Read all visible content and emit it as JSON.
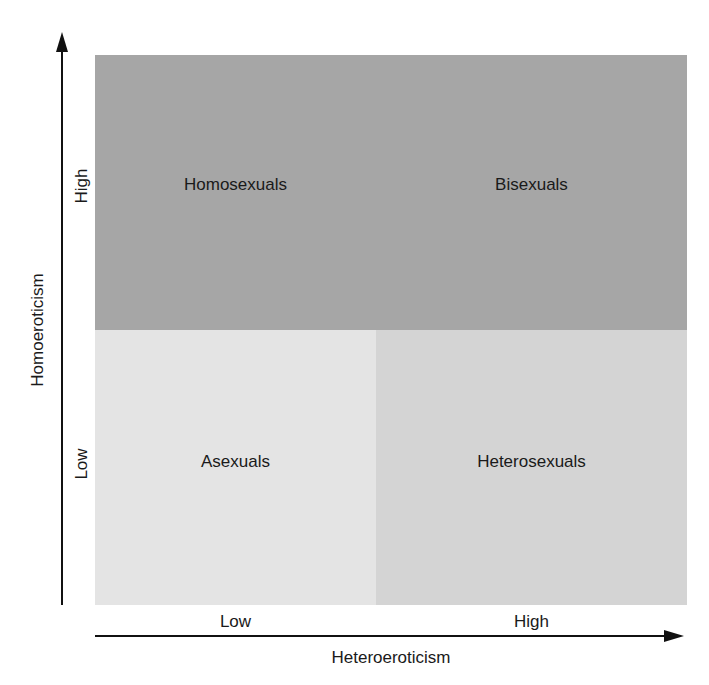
{
  "diagram": {
    "quadrants": [
      {
        "id": "top-left",
        "label": "Homosexuals",
        "color": "#a6a6a6"
      },
      {
        "id": "top-right",
        "label": "Bisexuals",
        "color": "#a6a6a6"
      },
      {
        "id": "bottom-left",
        "label": "Asexuals",
        "color": "#e4e4e4"
      },
      {
        "id": "bottom-right",
        "label": "Heterosexuals",
        "color": "#d4d4d4"
      }
    ],
    "y_axis": {
      "label": "Homoeroticism",
      "ticks": [
        "High",
        "Low"
      ]
    },
    "x_axis": {
      "label": "Heteroeroticism",
      "ticks": [
        "Low",
        "High"
      ]
    }
  }
}
